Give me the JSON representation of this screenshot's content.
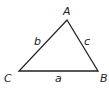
{
  "diagram": {
    "type": "triangle",
    "stroke_color": "#222222",
    "vertices": [
      {
        "label": "A",
        "x": 67,
        "y": 20
      },
      {
        "label": "B",
        "x": 98,
        "y": 71
      },
      {
        "label": "C",
        "x": 19,
        "y": 71
      }
    ],
    "sides": [
      {
        "label": "a",
        "between": "C-B"
      },
      {
        "label": "b",
        "between": "C-A"
      },
      {
        "label": "c",
        "between": "A-B"
      }
    ],
    "labels": {
      "A": "A",
      "B": "B",
      "C": "C",
      "a": "a",
      "b": "b",
      "c": "c"
    }
  }
}
